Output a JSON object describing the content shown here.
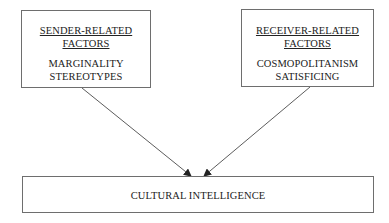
{
  "diagram": {
    "sender_box": {
      "heading_lines": [
        "SENDER-RELATED",
        "FACTORS"
      ],
      "factors": [
        "MARGINALITY",
        "STEREOTYPES"
      ]
    },
    "receiver_box": {
      "heading_lines": [
        "RECEIVER-RELATED",
        "FACTORS"
      ],
      "factors": [
        "COSMOPOLITANISM",
        "SATISFICING"
      ]
    },
    "outcome_box": {
      "label": "CULTURAL INTELLIGENCE"
    },
    "edges": [
      {
        "from": "sender_box",
        "to": "outcome_box",
        "type": "arrow"
      },
      {
        "from": "receiver_box",
        "to": "outcome_box",
        "type": "arrow"
      }
    ],
    "colors": {
      "border": "#6e6e6e",
      "arrow": "#333333",
      "text": "#222222"
    }
  }
}
